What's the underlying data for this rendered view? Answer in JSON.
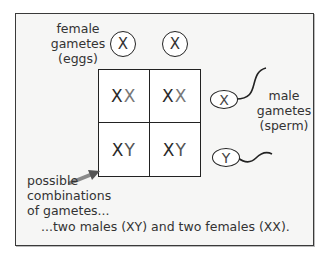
{
  "diagram": {
    "female_label": [
      "female",
      "gametes",
      "(eggs)"
    ],
    "male_label": [
      "male",
      "gametes",
      "(sperm)"
    ],
    "female_gametes": [
      "X",
      "X"
    ],
    "male_gametes": [
      "X",
      "Y"
    ],
    "grid": {
      "cells": [
        {
          "first": "X",
          "second": "X"
        },
        {
          "first": "X",
          "second": "X"
        },
        {
          "first": "X",
          "second": "Y"
        },
        {
          "first": "X",
          "second": "Y"
        }
      ]
    },
    "arrow_label": [
      "possible",
      "combinations",
      "of gametes..."
    ],
    "conclusion": "...two males (XY) and two females (XX).",
    "colors": {
      "frame_border": "#3a3a3a",
      "frame_fill": "#f6f6f5",
      "text": "#333333",
      "arrow": "#6a6a6a"
    }
  }
}
